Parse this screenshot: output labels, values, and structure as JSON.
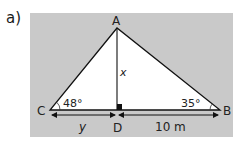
{
  "part_label": "a)",
  "colors": {
    "panel": "#c9c9c9",
    "triangle_fill": "#ffffff",
    "line": "#111111"
  },
  "vertices": {
    "A": "A",
    "B": "B",
    "C": "C",
    "D": "D"
  },
  "angles": {
    "C": "48°",
    "B": "35°"
  },
  "labels": {
    "height": "x",
    "cd_length": "y",
    "db_length": "10 m"
  }
}
